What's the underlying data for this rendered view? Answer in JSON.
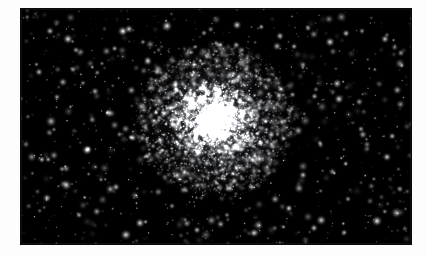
{
  "page": {
    "background_color": "#fdfdfd",
    "width": 426,
    "height": 256,
    "caption": ""
  },
  "plate": {
    "name": "globular-cluster-photograph",
    "description": "Monochrome astronomical photograph of a globular star cluster",
    "background_color": "#000000",
    "star_color": "#ffffff",
    "left": 21,
    "top": 9,
    "width": 390,
    "height": 235
  },
  "chart_data": {
    "type": "scatter",
    "title": "",
    "xlabel": "",
    "ylabel": "",
    "xlim": [
      0,
      390
    ],
    "ylim": [
      0,
      235
    ],
    "grid": false,
    "legend": "none",
    "background": "#000000",
    "cluster": {
      "name": "globular-cluster-core",
      "center_x": 194,
      "center_y": 111,
      "core_radius": 22,
      "halo_radius": 78,
      "core_star_count": 2600,
      "halo_star_count": 1700,
      "peak_brightness": 1.0
    },
    "field": {
      "name": "foreground-star-field",
      "star_count": 900,
      "min_radius": 0.4,
      "max_radius": 2.2,
      "min_brightness": 0.12,
      "max_brightness": 1.0
    },
    "bright_field_stars": [
      {
        "x": 29,
        "y": 22,
        "r": 1.6,
        "b": 0.78
      },
      {
        "x": 47,
        "y": 30,
        "r": 2.0,
        "b": 0.92
      },
      {
        "x": 55,
        "y": 41,
        "r": 1.4,
        "b": 0.7
      },
      {
        "x": 108,
        "y": 20,
        "r": 1.7,
        "b": 0.84
      },
      {
        "x": 122,
        "y": 33,
        "r": 1.2,
        "b": 0.62
      },
      {
        "x": 146,
        "y": 17,
        "r": 2.1,
        "b": 0.95
      },
      {
        "x": 183,
        "y": 24,
        "r": 1.3,
        "b": 0.66
      },
      {
        "x": 199,
        "y": 36,
        "r": 1.5,
        "b": 0.74
      },
      {
        "x": 216,
        "y": 16,
        "r": 1.8,
        "b": 0.88
      },
      {
        "x": 259,
        "y": 27,
        "r": 1.6,
        "b": 0.8
      },
      {
        "x": 287,
        "y": 19,
        "r": 1.4,
        "b": 0.71
      },
      {
        "x": 309,
        "y": 33,
        "r": 1.9,
        "b": 0.9
      },
      {
        "x": 341,
        "y": 22,
        "r": 1.3,
        "b": 0.64
      },
      {
        "x": 364,
        "y": 30,
        "r": 1.7,
        "b": 0.82
      },
      {
        "x": 380,
        "y": 44,
        "r": 1.5,
        "b": 0.76
      },
      {
        "x": 18,
        "y": 63,
        "r": 1.6,
        "b": 0.79
      },
      {
        "x": 36,
        "y": 88,
        "r": 1.4,
        "b": 0.69
      },
      {
        "x": 62,
        "y": 74,
        "r": 1.2,
        "b": 0.6
      },
      {
        "x": 88,
        "y": 104,
        "r": 1.8,
        "b": 0.86
      },
      {
        "x": 112,
        "y": 129,
        "r": 1.5,
        "b": 0.75
      },
      {
        "x": 66,
        "y": 141,
        "r": 2.0,
        "b": 0.93
      },
      {
        "x": 41,
        "y": 160,
        "r": 1.3,
        "b": 0.65
      },
      {
        "x": 26,
        "y": 189,
        "r": 1.7,
        "b": 0.83
      },
      {
        "x": 58,
        "y": 206,
        "r": 1.4,
        "b": 0.72
      },
      {
        "x": 95,
        "y": 178,
        "r": 1.6,
        "b": 0.78
      },
      {
        "x": 119,
        "y": 214,
        "r": 1.9,
        "b": 0.91
      },
      {
        "x": 151,
        "y": 197,
        "r": 1.3,
        "b": 0.63
      },
      {
        "x": 176,
        "y": 221,
        "r": 1.5,
        "b": 0.77
      },
      {
        "x": 206,
        "y": 206,
        "r": 1.2,
        "b": 0.61
      },
      {
        "x": 233,
        "y": 224,
        "r": 1.8,
        "b": 0.87
      },
      {
        "x": 268,
        "y": 199,
        "r": 1.4,
        "b": 0.7
      },
      {
        "x": 293,
        "y": 219,
        "r": 1.6,
        "b": 0.81
      },
      {
        "x": 327,
        "y": 190,
        "r": 1.3,
        "b": 0.66
      },
      {
        "x": 356,
        "y": 212,
        "r": 2.1,
        "b": 0.96
      },
      {
        "x": 379,
        "y": 180,
        "r": 1.5,
        "b": 0.74
      },
      {
        "x": 366,
        "y": 148,
        "r": 1.7,
        "b": 0.85
      },
      {
        "x": 340,
        "y": 120,
        "r": 1.4,
        "b": 0.68
      },
      {
        "x": 318,
        "y": 90,
        "r": 1.9,
        "b": 0.89
      },
      {
        "x": 299,
        "y": 134,
        "r": 1.3,
        "b": 0.64
      },
      {
        "x": 282,
        "y": 166,
        "r": 1.6,
        "b": 0.8
      },
      {
        "x": 136,
        "y": 63,
        "r": 1.5,
        "b": 0.73
      },
      {
        "x": 160,
        "y": 86,
        "r": 1.2,
        "b": 0.59
      },
      {
        "x": 248,
        "y": 71,
        "r": 1.4,
        "b": 0.71
      },
      {
        "x": 264,
        "y": 112,
        "r": 1.3,
        "b": 0.67
      },
      {
        "x": 231,
        "y": 178,
        "r": 1.5,
        "b": 0.76
      }
    ]
  }
}
